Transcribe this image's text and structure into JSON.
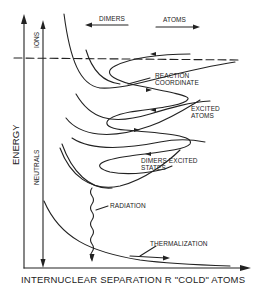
{
  "diagram": {
    "title": "",
    "x_axis_label": "INTERNUCLEAR SEPARATION R \"COLD\" ATOMS",
    "y_axis_label": "ENERGY",
    "direction_labels": {
      "left": "DIMERS",
      "right": "ATOMS"
    },
    "vertical_arrows": {
      "up": "IONS",
      "down": "NEUTRALS"
    },
    "annotations": {
      "reaction_coordinate": [
        "REACTION",
        "COORDINATE"
      ],
      "excited_atoms": [
        "EXCITED",
        "ATOMS"
      ],
      "dimers_excited_states": [
        "DIMERS EXCITED",
        "STATES"
      ],
      "radiation": "RADIATION",
      "thermalization": "THERMALIZATION"
    },
    "colors": {
      "ink": "#222222",
      "background": "#ffffff"
    }
  }
}
